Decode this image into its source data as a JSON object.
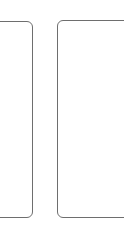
{
  "panels": [
    {
      "id": "left",
      "content": ""
    },
    {
      "id": "right",
      "content": ""
    }
  ],
  "colors": {
    "border": "#6e6e6e",
    "background": "#ffffff"
  }
}
